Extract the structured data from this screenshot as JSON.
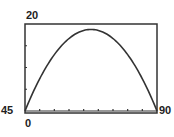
{
  "chart_data": {
    "type": "line",
    "title": "",
    "xlabel": "",
    "ylabel": "",
    "xlim": [
      0,
      90
    ],
    "ylim": [
      0,
      20
    ],
    "x_tick_step": 10,
    "y_tick_step": 5,
    "grid": false,
    "legend": null,
    "window_labels": {
      "ymax": "20",
      "xmin": "45",
      "xmax": "90",
      "origin": "0"
    },
    "series": [
      {
        "name": "curve",
        "x": [
          0,
          10,
          20,
          30,
          40,
          45,
          50,
          60,
          70,
          80,
          90
        ],
        "y": [
          0,
          7.4,
          13.0,
          16.7,
          18.5,
          18.75,
          18.5,
          16.7,
          13.0,
          7.4,
          0
        ]
      }
    ],
    "colors": {
      "curve": "#333333",
      "frame": "#333333"
    }
  }
}
